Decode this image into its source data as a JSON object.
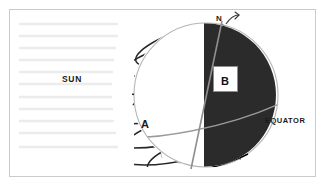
{
  "diagram": {
    "frame": {
      "border_color": "#c9cbcd",
      "background_color": "#ffffff"
    },
    "labels": {
      "sun": "SUN",
      "equator": "EQUATOR",
      "north_pole": "N",
      "point_a": "A",
      "point_b": "B"
    },
    "colors": {
      "night_hemisphere": "#2b2b2b",
      "day_hemisphere": "#ffffff",
      "sphere_outline": "#b5b5b5",
      "parallel_line": "#262626",
      "meridian_line": "#a8a8a8",
      "axis_line": "#8f8f8f",
      "sun_ray": "#ececec",
      "label_text": "#1a1a1a"
    },
    "sphere": {
      "center_x": 206,
      "center_y": 95,
      "radius": 72
    },
    "terminator": {
      "x": 204,
      "orientation": "vertical",
      "description": "day/night boundary"
    },
    "axis": {
      "tilt_description": "tilted rotation axis through the north pole",
      "top_x": 221,
      "top_y": 22,
      "bottom_x": 192,
      "bottom_y": 168
    },
    "rotation_arrow": {
      "name": "rotation-direction-arrow",
      "description": "curved arrow at the north pole showing rotation"
    },
    "sun_rays": {
      "count": 11,
      "orientation": "horizontal",
      "side": "left",
      "description": "parallel horizontal rays of sunlight travelling from the sun toward the earth"
    },
    "parallels": {
      "count": 6,
      "description": "latitude circles drawn as ellipses across the globe"
    }
  }
}
